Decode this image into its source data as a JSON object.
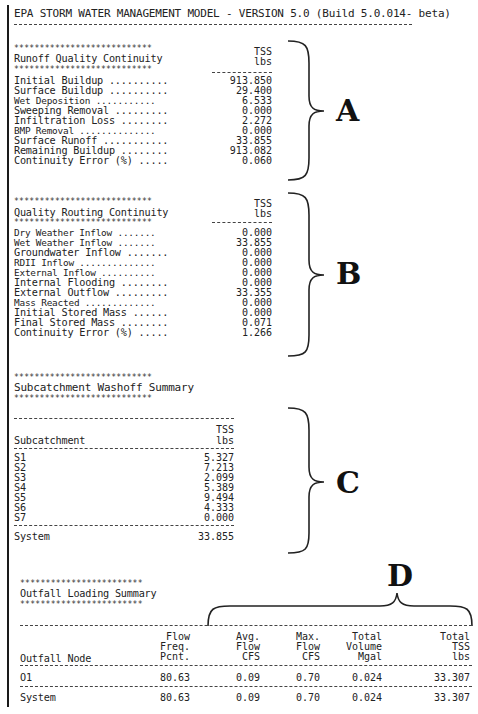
{
  "header": {
    "title": "EPA STORM WATER MANAGEMENT MODEL - VERSION 5.0 (Build 5.0.014- beta)"
  },
  "runoff_quality": {
    "title": "Runoff Quality Continuity",
    "unit_top": "TSS",
    "unit_bottom": "lbs",
    "rows": [
      {
        "label": "Initial Buildup ..........",
        "value": "913.850"
      },
      {
        "label": "Surface Buildup ..........",
        "value": "29.400"
      },
      {
        "label": "Wet Deposition ...........",
        "value": "6.533"
      },
      {
        "label": "Sweeping Removal .........",
        "value": "0.000"
      },
      {
        "label": "Infiltration Loss ........",
        "value": "2.272"
      },
      {
        "label": "BMP Removal ..............",
        "value": "0.000"
      },
      {
        "label": "Surface Runoff ...........",
        "value": "33.855"
      },
      {
        "label": "Remaining Buildup ........",
        "value": "913.082"
      },
      {
        "label": "Continuity Error (%) .....",
        "value": "0.060"
      }
    ],
    "annotation": "A"
  },
  "quality_routing": {
    "title": "Quality Routing Continuity",
    "unit_top": "TSS",
    "unit_bottom": "lbs",
    "rows": [
      {
        "label": "Dry Weather Inflow .......",
        "value": "0.000"
      },
      {
        "label": "Wet Weather Inflow .......",
        "value": "33.855"
      },
      {
        "label": "Groundwater Inflow .......",
        "value": "0.000"
      },
      {
        "label": "RDII Inflow ..............",
        "value": "0.000"
      },
      {
        "label": "External Inflow ..........",
        "value": "0.000"
      },
      {
        "label": "Internal Flooding ........",
        "value": "0.000"
      },
      {
        "label": "External Outflow .........",
        "value": "33.355"
      },
      {
        "label": "Mass Reacted .............",
        "value": "0.000"
      },
      {
        "label": "Initial Stored Mass ......",
        "value": "0.000"
      },
      {
        "label": "Final Stored Mass ........",
        "value": "0.071"
      },
      {
        "label": "Continuity Error (%) .....",
        "value": "1.266"
      }
    ],
    "annotation": "B"
  },
  "washoff": {
    "title": "Subcatchment Washoff Summary",
    "col_header": "Subcatchment",
    "unit_top": "TSS",
    "unit_bottom": "lbs",
    "rows": [
      {
        "name": "S1",
        "value": "5.327"
      },
      {
        "name": "S2",
        "value": "7.213"
      },
      {
        "name": "S3",
        "value": "2.099"
      },
      {
        "name": "S4",
        "value": "5.389"
      },
      {
        "name": "S5",
        "value": "9.494"
      },
      {
        "name": "S6",
        "value": "4.333"
      },
      {
        "name": "S7",
        "value": "0.000"
      }
    ],
    "total": {
      "name": "System",
      "value": "33.855"
    },
    "annotation": "C"
  },
  "outfall": {
    "title": "Outfall Loading Summary",
    "columns": [
      {
        "l1": "",
        "l2": "",
        "l3": "Outfall Node"
      },
      {
        "l1": "Flow",
        "l2": "Freq.",
        "l3": "Pcnt."
      },
      {
        "l1": "Avg.",
        "l2": "Flow",
        "l3": "CFS"
      },
      {
        "l1": "Max.",
        "l2": "Flow",
        "l3": "CFS"
      },
      {
        "l1": "Total",
        "l2": "Volume",
        "l3": "Mgal"
      },
      {
        "l1": "Total",
        "l2": "TSS",
        "l3": "lbs"
      }
    ],
    "rows": [
      {
        "node": "O1",
        "freq": "80.63",
        "avg": "0.09",
        "max": "0.70",
        "vol": "0.024",
        "tss": "33.307"
      }
    ],
    "total": {
      "node": "System",
      "freq": "80.63",
      "avg": "0.09",
      "max": "0.70",
      "vol": "0.024",
      "tss": "33.307"
    },
    "annotation": "D"
  },
  "decor": {
    "stars": "***************************",
    "stars_short": "************************"
  }
}
